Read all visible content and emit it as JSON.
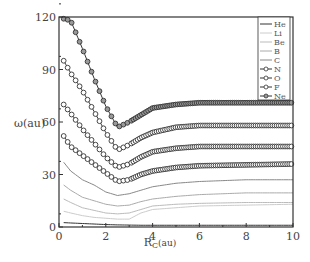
{
  "chart_data": {
    "type": "line",
    "title": "",
    "xlabel": "R_C(au)",
    "ylabel": "ω(au)",
    "xlim": [
      0,
      10
    ],
    "ylim": [
      0,
      120
    ],
    "xticks": [
      0,
      2,
      4,
      6,
      8,
      10
    ],
    "yticks": [
      0,
      30,
      60,
      90,
      120
    ],
    "legend_position": "upper right",
    "grid": false,
    "x": [
      0.2,
      0.5,
      1.0,
      1.5,
      2.0,
      2.5,
      3.0,
      3.5,
      4.0,
      5.0,
      6.0,
      8.0,
      10.0
    ],
    "series": [
      {
        "name": "He",
        "marker": "none",
        "color": "#333333",
        "values": [
          2.5,
          2.3,
          2.0,
          1.7,
          1.4,
          1.2,
          1.1,
          1.0,
          1.0,
          1.0,
          1.0,
          1.0,
          1.0
        ]
      },
      {
        "name": "Li",
        "marker": "none",
        "color": "#cccccc",
        "values": [
          9,
          8,
          6.5,
          5.5,
          5,
          4.5,
          4.5,
          8,
          10,
          11,
          12,
          12.5,
          13
        ]
      },
      {
        "name": "Be",
        "marker": "none",
        "color": "#bbbbbb",
        "values": [
          16,
          14,
          11,
          9.5,
          8,
          7.5,
          8,
          10,
          12,
          13,
          13.5,
          14,
          14
        ]
      },
      {
        "name": "B",
        "marker": "none",
        "color": "#aaaaaa",
        "values": [
          24,
          21,
          17,
          15,
          13,
          12,
          12.5,
          14.5,
          16,
          17.5,
          18.5,
          19.5,
          19.5
        ]
      },
      {
        "name": "C",
        "marker": "none",
        "color": "#888888",
        "values": [
          37,
          32,
          27,
          24,
          20,
          18,
          19,
          21,
          23,
          25,
          26,
          27,
          27
        ]
      },
      {
        "name": "N",
        "marker": "circle",
        "color": "#333333",
        "values": [
          52,
          46,
          41,
          36,
          31,
          26,
          27,
          30,
          32,
          34,
          35,
          35.5,
          36
        ]
      },
      {
        "name": "O",
        "marker": "circle",
        "color": "#333333",
        "values": [
          70,
          65,
          56,
          48,
          40,
          34,
          36,
          40,
          43,
          45,
          46,
          46,
          46
        ]
      },
      {
        "name": "F",
        "marker": "circle",
        "color": "#333333",
        "values": [
          95,
          88,
          78,
          66,
          54,
          44,
          47,
          51,
          54,
          57,
          58,
          58,
          58
        ]
      },
      {
        "name": "Ne",
        "marker": "circle",
        "color": "#333333",
        "values": [
          119,
          118,
          102,
          85,
          69,
          57,
          60,
          64,
          68,
          70,
          71,
          71,
          71
        ]
      }
    ]
  },
  "axes": {
    "xlabel_main": "R",
    "xlabel_sub": "C",
    "xlabel_unit": "(au)",
    "ylabel": "ω(au)"
  }
}
